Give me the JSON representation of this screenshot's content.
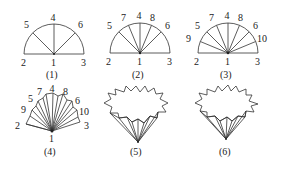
{
  "figures": [
    {
      "caption": "(1)",
      "labels": {
        "p1": "1",
        "p2": "2",
        "p3": "3",
        "p4": "4",
        "p5": "5",
        "p6": "6"
      }
    },
    {
      "caption": "(2)",
      "labels": {
        "p1": "1",
        "p2": "2",
        "p3": "3",
        "p4": "4",
        "p5": "5",
        "p6": "6",
        "p7": "7",
        "p8": "8"
      }
    },
    {
      "caption": "(3)",
      "labels": {
        "p1": "1",
        "p2": "2",
        "p3": "3",
        "p4": "4",
        "p5": "5",
        "p6": "6",
        "p7": "7",
        "p8": "8",
        "p9": "9",
        "p10": "10"
      }
    },
    {
      "caption": "(4)",
      "labels": {
        "p1": "1",
        "p2": "2",
        "p3": "3",
        "p4": "4",
        "p5": "5",
        "p6": "6",
        "p7": "7",
        "p8": "8",
        "p9": "9",
        "p10": "10"
      }
    },
    {
      "caption": "(5)"
    },
    {
      "caption": "(6)"
    }
  ]
}
